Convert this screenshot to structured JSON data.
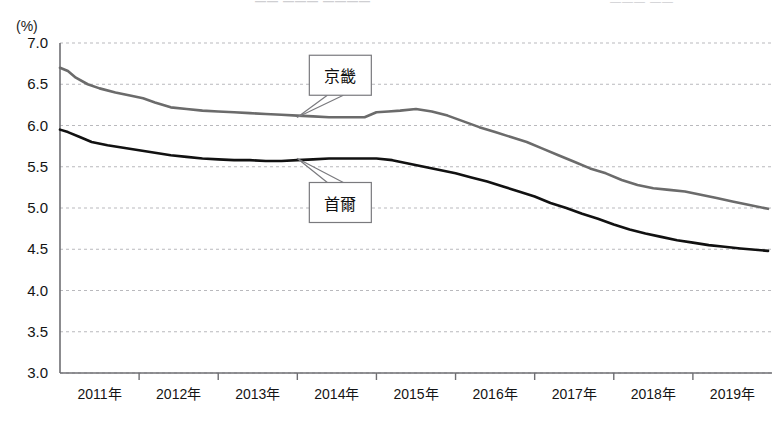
{
  "top_strip": {
    "center_faded": "—— ——— ————",
    "right_faded": "———   ——"
  },
  "axis_unit_label": "(%)",
  "callouts": [
    {
      "name": "gyeonggi",
      "label": "京畿"
    },
    {
      "name": "seoul",
      "label": "首爾"
    }
  ],
  "chart_data": {
    "type": "line",
    "title": "",
    "subtitle": "",
    "xlabel": "",
    "ylabel": "(%)",
    "ylim": [
      3.0,
      7.0
    ],
    "ytick_labels": [
      "7.0",
      "6.5",
      "6.0",
      "5.5",
      "5.0",
      "4.5",
      "4.0",
      "3.5",
      "3.0"
    ],
    "ytick_values": [
      7.0,
      6.5,
      6.0,
      5.5,
      5.0,
      4.5,
      4.0,
      3.5,
      3.0
    ],
    "xtick_labels": [
      "2011年",
      "2012年",
      "2013年",
      "2014年",
      "2015年",
      "2016年",
      "2017年",
      "2018年",
      "2019年"
    ],
    "x_start_year": 2011,
    "x_end_year": 2020,
    "grid": true,
    "grid_style": "dotted-horizontal",
    "legend_position": "inline-callouts",
    "series": [
      {
        "name": "京畿",
        "color": "#6b6b6b",
        "x": [
          2011.0,
          2011.1,
          2011.2,
          2011.35,
          2011.5,
          2011.7,
          2011.9,
          2012.05,
          2012.2,
          2012.4,
          2012.6,
          2012.8,
          2013.0,
          2013.2,
          2013.4,
          2013.6,
          2013.8,
          2014.0,
          2014.2,
          2014.4,
          2014.55,
          2014.7,
          2014.85,
          2015.0,
          2015.15,
          2015.3,
          2015.5,
          2015.7,
          2015.9,
          2016.1,
          2016.3,
          2016.5,
          2016.7,
          2016.9,
          2017.1,
          2017.3,
          2017.5,
          2017.7,
          2017.9,
          2018.1,
          2018.3,
          2018.5,
          2018.7,
          2018.9,
          2019.1,
          2019.3,
          2019.5,
          2019.7,
          2019.95
        ],
        "values": [
          6.7,
          6.66,
          6.58,
          6.5,
          6.45,
          6.4,
          6.36,
          6.33,
          6.28,
          6.22,
          6.2,
          6.18,
          6.17,
          6.16,
          6.15,
          6.14,
          6.13,
          6.12,
          6.11,
          6.1,
          6.1,
          6.1,
          6.1,
          6.16,
          6.17,
          6.18,
          6.2,
          6.17,
          6.12,
          6.05,
          5.98,
          5.92,
          5.86,
          5.8,
          5.72,
          5.64,
          5.56,
          5.48,
          5.42,
          5.34,
          5.28,
          5.24,
          5.22,
          5.2,
          5.16,
          5.12,
          5.08,
          5.04,
          4.99
        ]
      },
      {
        "name": "首爾",
        "color": "#111111",
        "x": [
          2011.0,
          2011.1,
          2011.25,
          2011.4,
          2011.6,
          2011.8,
          2012.0,
          2012.2,
          2012.4,
          2012.6,
          2012.8,
          2013.0,
          2013.2,
          2013.4,
          2013.6,
          2013.8,
          2014.0,
          2014.2,
          2014.4,
          2014.6,
          2014.8,
          2015.0,
          2015.2,
          2015.4,
          2015.6,
          2015.8,
          2016.0,
          2016.2,
          2016.4,
          2016.6,
          2016.8,
          2017.0,
          2017.2,
          2017.4,
          2017.6,
          2017.8,
          2018.0,
          2018.2,
          2018.4,
          2018.6,
          2018.8,
          2019.0,
          2019.2,
          2019.4,
          2019.6,
          2019.95
        ],
        "values": [
          5.95,
          5.92,
          5.86,
          5.8,
          5.76,
          5.73,
          5.7,
          5.67,
          5.64,
          5.62,
          5.6,
          5.59,
          5.58,
          5.58,
          5.57,
          5.57,
          5.58,
          5.59,
          5.6,
          5.6,
          5.6,
          5.6,
          5.58,
          5.54,
          5.5,
          5.46,
          5.42,
          5.37,
          5.32,
          5.26,
          5.2,
          5.14,
          5.06,
          5.0,
          4.93,
          4.87,
          4.8,
          4.74,
          4.69,
          4.65,
          4.61,
          4.58,
          4.55,
          4.53,
          4.51,
          4.48
        ]
      }
    ],
    "annotations": [
      {
        "text": "京畿",
        "points_to_series": "京畿",
        "x": 2014.0,
        "y": 6.1,
        "placement": "above"
      },
      {
        "text": "首爾",
        "points_to_series": "首爾",
        "x": 2014.0,
        "y": 5.6,
        "placement": "below"
      }
    ]
  }
}
